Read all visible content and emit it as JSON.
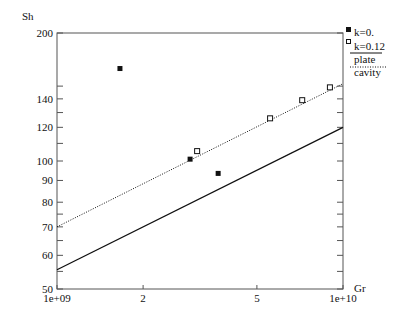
{
  "chart_data": {
    "type": "scatter",
    "title": "",
    "xlabel": "Gr",
    "ylabel": "Sh",
    "xscale": "log",
    "yscale": "log",
    "xlim": [
      1000000000,
      10000000000
    ],
    "ylim": [
      50,
      200
    ],
    "x_ticks": [
      {
        "value": 1000000000,
        "label": "1e+09"
      },
      {
        "value": 2000000000,
        "label": "2"
      },
      {
        "value": 5000000000,
        "label": "5"
      },
      {
        "value": 10000000000,
        "label": "1e+10"
      }
    ],
    "y_ticks": [
      {
        "value": 50,
        "label": "50"
      },
      {
        "value": 60,
        "label": "60"
      },
      {
        "value": 70,
        "label": "70"
      },
      {
        "value": 80,
        "label": "80"
      },
      {
        "value": 90,
        "label": "90"
      },
      {
        "value": 100,
        "label": "100"
      },
      {
        "value": 120,
        "label": "120"
      },
      {
        "value": 140,
        "label": "140"
      },
      {
        "value": 200,
        "label": "200"
      }
    ],
    "y_minor_ticks": [
      55,
      65,
      75,
      110,
      130,
      150
    ],
    "grid": false,
    "legend_position": "right-top outside",
    "series": [
      {
        "name": "k=0.",
        "marker": "filled-square",
        "points": [
          [
            1660000000,
            165
          ],
          [
            2920000000,
            101
          ],
          [
            3660000000,
            93.5
          ]
        ]
      },
      {
        "name": "k=0.12",
        "marker": "open-square",
        "points": [
          [
            3090000000,
            105.5
          ],
          [
            5560000000,
            126
          ],
          [
            7200000000,
            139
          ],
          [
            9000000000,
            149
          ]
        ]
      },
      {
        "name": "plate",
        "style": "solid-line",
        "points": [
          [
            1000000000,
            55.5
          ],
          [
            10000000000,
            120
          ]
        ]
      },
      {
        "name": "cavity",
        "style": "dotted-line",
        "points": [
          [
            1000000000,
            70
          ],
          [
            10000000000,
            152
          ]
        ]
      }
    ]
  }
}
